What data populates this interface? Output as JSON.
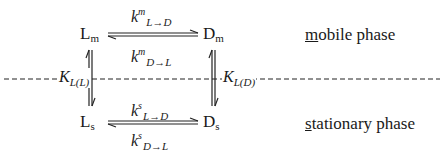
{
  "diagram": {
    "type": "kinetic-equilibrium-scheme",
    "species": {
      "mobile_left": {
        "base": "L",
        "sub": "m"
      },
      "mobile_right": {
        "base": "D",
        "sub": "m"
      },
      "stat_left": {
        "base": "L",
        "sub": "s"
      },
      "stat_right": {
        "base": "D",
        "sub": "s"
      }
    },
    "rates": {
      "mobile_forward": {
        "base": "k",
        "sup": "m",
        "sub": "L→D"
      },
      "mobile_backward": {
        "base": "k",
        "sup": "m",
        "sub": "D→L"
      },
      "stat_forward": {
        "base": "k",
        "sup": "s",
        "sub": "L→D"
      },
      "stat_backward": {
        "base": "k",
        "sup": "s",
        "sub": "D→L"
      }
    },
    "equilibria": {
      "left": {
        "base": "K",
        "sub": "L(L)"
      },
      "right": {
        "base": "K",
        "sub": "L(D)"
      }
    },
    "phases": {
      "mobile": {
        "underlined": "m",
        "rest": "obile phase"
      },
      "stationary": {
        "underlined": "s",
        "rest": "tationary phase"
      }
    },
    "colors": {
      "ink": "#1a1a1a",
      "background": "#ffffff"
    }
  }
}
